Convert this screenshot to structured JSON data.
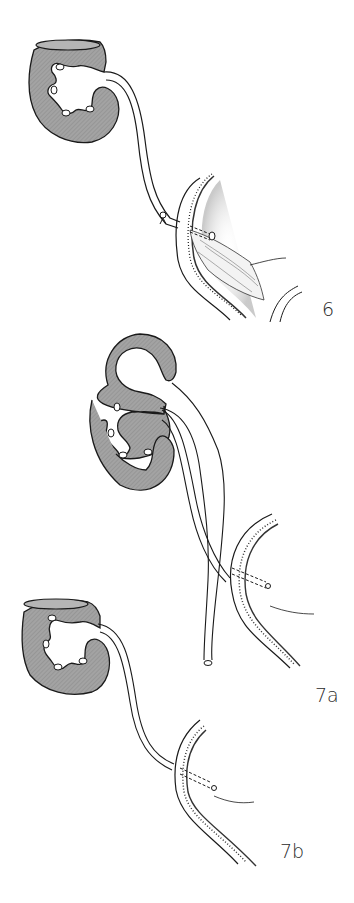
{
  "figure": {
    "panels": [
      {
        "id": "6",
        "label": "6",
        "description": "Kidney with ureter entering bladder wall, ligature clip on ureter, intravesical opened bladder with mucosa"
      },
      {
        "id": "7a",
        "label": "7a",
        "description": "Kidney with dilated pelvis, double ureter, one tunneled into bladder wall, other ureter cut end"
      },
      {
        "id": "7b",
        "label": "7b",
        "description": "Kidney with single ureter tunneled through bladder wall"
      }
    ],
    "colors": {
      "kidney_fill": "#9a9a9a",
      "outline": "#1a1a1a",
      "background": "#ffffff",
      "stipple": "#777777"
    }
  }
}
